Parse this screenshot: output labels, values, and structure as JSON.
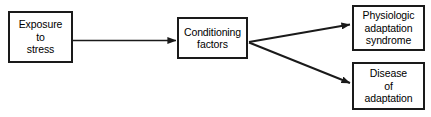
{
  "diagram": {
    "background_color": "#ffffff",
    "line_color": "#1a1a1a",
    "text_color": "#000000",
    "nodes": [
      {
        "id": "exposure",
        "label": "Exposure\nto\nstress",
        "shape": "rectangle"
      },
      {
        "id": "conditioning",
        "label": "Conditioning\nfactors",
        "shape": "rectangle"
      },
      {
        "id": "physiologic",
        "label": "Physiologic\nadaptation\nsyndrome",
        "shape": "rectangle"
      },
      {
        "id": "disease",
        "label": "Disease\nof\nadaptation",
        "shape": "rectangle"
      }
    ],
    "edges": [
      {
        "id": "edge-exposure-conditioning",
        "from": "exposure",
        "to": "conditioning",
        "style": "solid-arrow"
      },
      {
        "id": "edge-conditioning-physiologic",
        "from": "conditioning",
        "to": "physiologic",
        "style": "solid-arrow"
      },
      {
        "id": "edge-conditioning-disease",
        "from": "conditioning",
        "to": "disease",
        "style": "solid-arrow"
      }
    ]
  }
}
